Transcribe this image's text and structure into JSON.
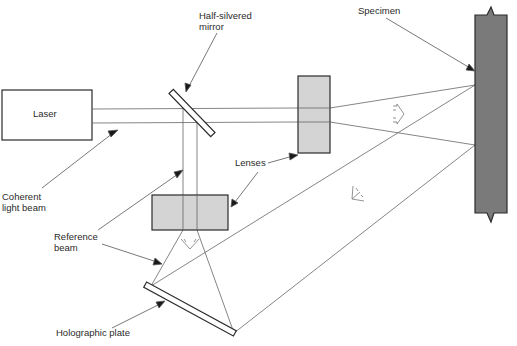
{
  "diagram": {
    "components": {
      "laser": "Laser",
      "mirror": "Half-silvered\nmirror",
      "lenses": "Lenses",
      "specimen": "Specimen",
      "coherent_beam": "Coherent\nlight beam",
      "reference_beam": "Reference\nbeam",
      "plate": "Holographic plate"
    },
    "colors": {
      "line": "#555555",
      "lens_fill": "#d4d4d4",
      "specimen_fill": "#7a7a7a",
      "outline": "#2a2a2a"
    }
  }
}
